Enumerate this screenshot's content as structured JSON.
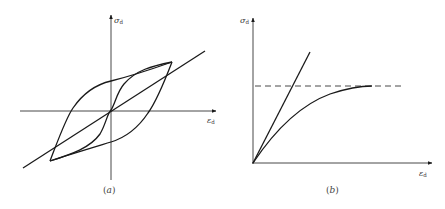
{
  "figure_a": {
    "caption_open": "(",
    "caption_letter": "a",
    "caption_close": ")",
    "y_axis_label": "σ",
    "y_axis_sub": "d",
    "x_axis_label": "ε",
    "x_axis_sub": "d",
    "description": "Hysteresis loop of dynamic stress vs dynamic strain with skeleton (backbone) line"
  },
  "figure_b": {
    "caption_open": "(",
    "caption_letter": "b",
    "caption_close": ")",
    "y_axis_label": "σ",
    "y_axis_sub": "d",
    "x_axis_label": "ε",
    "x_axis_sub": "d",
    "description": "Backbone curve approaching horizontal asymptote (dashed) with initial tangent line"
  },
  "colors": {
    "line": "#1a1a1a",
    "label": "#333333",
    "background": "#ffffff"
  }
}
